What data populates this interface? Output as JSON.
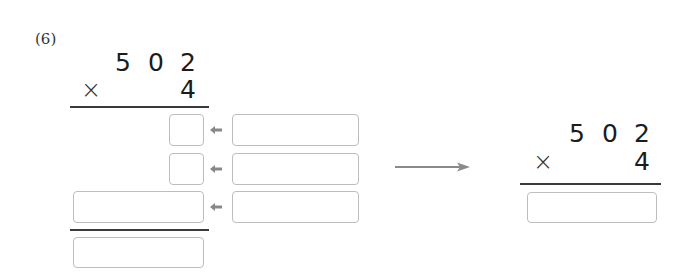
{
  "problem": {
    "number_label": "(6)",
    "multiplicand_digits": [
      "5",
      "0",
      "2"
    ],
    "operator": "×",
    "multiplier": "4"
  },
  "left_work": {
    "partial_rows": [
      {
        "answer_box": "",
        "hint_box": ""
      },
      {
        "answer_box": "",
        "hint_box": ""
      },
      {
        "answer_box": "",
        "hint_box": ""
      }
    ],
    "total_box": ""
  },
  "right_work": {
    "multiplicand_digits": [
      "5",
      "0",
      "2"
    ],
    "operator": "×",
    "multiplier": "4",
    "answer_box": ""
  },
  "colors": {
    "box_border": "#bdbdbd",
    "arrow": "#888888",
    "rule": "#3a3a3a"
  }
}
